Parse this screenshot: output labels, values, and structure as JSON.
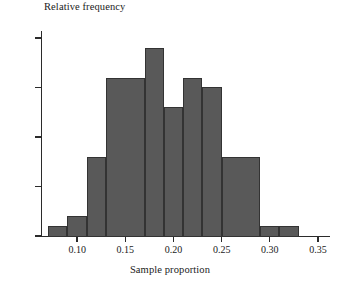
{
  "chart_data": {
    "type": "bar",
    "title": "",
    "xlabel": "Sample proportion",
    "ylabel": "Relative frequency",
    "bin_width": 0.02,
    "bin_start": 0.07,
    "categories": [
      "0.07-0.09",
      "0.09-0.11",
      "0.11-0.13",
      "0.13-0.15",
      "0.15-0.17",
      "0.17-0.19",
      "0.19-0.21",
      "0.21-0.23",
      "0.23-0.25",
      "0.25-0.27",
      "0.27-0.29",
      "0.29-0.31",
      "0.31-0.33",
      "0.33-0.35"
    ],
    "bin_edges": [
      0.07,
      0.09,
      0.11,
      0.13,
      0.15,
      0.17,
      0.19,
      0.21,
      0.23,
      0.25,
      0.27,
      0.29,
      0.31,
      0.33,
      0.35
    ],
    "values": [
      0.01,
      0.02,
      0.08,
      0.16,
      0.16,
      0.19,
      0.13,
      0.13,
      0.16,
      0.15,
      0.08,
      0.01,
      0.01,
      0.0
    ],
    "bars": [
      {
        "x0": 0.07,
        "x1": 0.09,
        "y": 0.01
      },
      {
        "x0": 0.09,
        "x1": 0.11,
        "y": 0.02
      },
      {
        "x0": 0.11,
        "x1": 0.13,
        "y": 0.08
      },
      {
        "x0": 0.13,
        "x1": 0.17,
        "y": 0.16
      },
      {
        "x0": 0.17,
        "x1": 0.19,
        "y": 0.19
      },
      {
        "x0": 0.19,
        "x1": 0.21,
        "y": 0.13
      },
      {
        "x0": 0.21,
        "x1": 0.23,
        "y": 0.16
      },
      {
        "x0": 0.23,
        "x1": 0.25,
        "y": 0.15
      },
      {
        "x0": 0.25,
        "x1": 0.29,
        "y": 0.08
      },
      {
        "x0": 0.29,
        "x1": 0.31,
        "y": 0.01
      },
      {
        "x0": 0.31,
        "x1": 0.33,
        "y": 0.01
      }
    ],
    "xlim": [
      0.0625,
      0.3625
    ],
    "ylim": [
      0.0,
      0.205
    ],
    "yticks": [
      0.0,
      0.05,
      0.1,
      0.15,
      0.2
    ],
    "ytick_labels": [
      "0.0",
      "0.5",
      "0.10",
      "0.15",
      "0.20"
    ],
    "xticks": [
      0.1,
      0.15,
      0.2,
      0.25,
      0.3,
      0.35
    ],
    "xtick_labels": [
      "0.10",
      "0.15",
      "0.20",
      "0.25",
      "0.30",
      "0.35"
    ],
    "grid": false,
    "legend": null,
    "bar_color": "#595959",
    "bar_edge_color": "#333333",
    "axis_color": "#2b2b2b"
  }
}
